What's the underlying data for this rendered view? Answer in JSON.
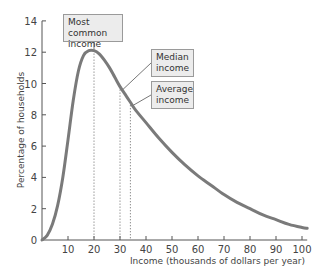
{
  "chart_data": {
    "type": "line",
    "title": "",
    "xlabel": "Income (thousands of dollars per year)",
    "ylabel": "Percentage of households",
    "xlim": [
      0,
      102
    ],
    "ylim": [
      0,
      14
    ],
    "x_ticks": [
      10,
      20,
      30,
      40,
      50,
      60,
      70,
      80,
      90,
      100
    ],
    "y_ticks": [
      0,
      2,
      4,
      6,
      8,
      10,
      12,
      14
    ],
    "grid": false,
    "series": [
      {
        "name": "Income distribution",
        "color": "#7a7a7a",
        "x": [
          0,
          2,
          4,
          6,
          8,
          10,
          12,
          14,
          16,
          18,
          20,
          22,
          24,
          26,
          28,
          30,
          32,
          34,
          36,
          40,
          45,
          50,
          55,
          60,
          65,
          70,
          75,
          80,
          85,
          90,
          95,
          100,
          102
        ],
        "values": [
          0,
          0.3,
          1.0,
          2.2,
          4.0,
          6.4,
          8.9,
          10.8,
          11.8,
          12.1,
          12.1,
          11.9,
          11.5,
          11.0,
          10.4,
          9.8,
          9.3,
          8.8,
          8.3,
          7.5,
          6.5,
          5.6,
          4.8,
          4.1,
          3.5,
          2.9,
          2.4,
          2.0,
          1.6,
          1.3,
          1.0,
          0.8,
          0.75
        ]
      }
    ],
    "annotations": [
      {
        "label": "Most common income",
        "x": 20,
        "y": 12.1
      },
      {
        "label": "Median income",
        "x": 30,
        "y": 9.8
      },
      {
        "label": "Average income",
        "x": 34,
        "y": 8.8
      }
    ]
  },
  "callouts": {
    "most_common": [
      "Most common",
      "income"
    ],
    "median": [
      "Median",
      "income"
    ],
    "average": [
      "Average",
      "income"
    ]
  }
}
